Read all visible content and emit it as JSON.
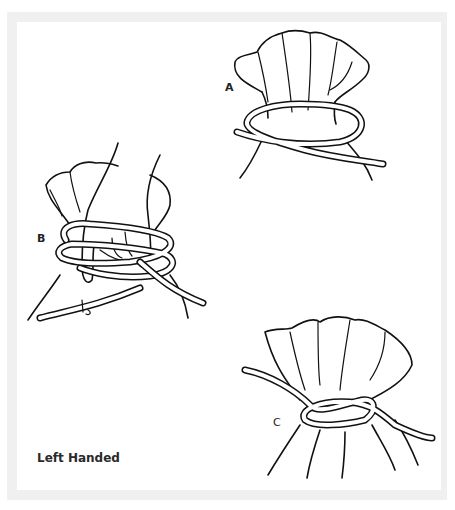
{
  "figure": {
    "caption": "Left Handed",
    "steps": [
      {
        "label": "A",
        "description": "rope looped around gathered neck of sack, ends crossed"
      },
      {
        "label": "B",
        "description": "hand holding sack neck while rope wraps twice around"
      },
      {
        "label": "C",
        "description": "rope tied in knot around sack neck"
      }
    ]
  }
}
